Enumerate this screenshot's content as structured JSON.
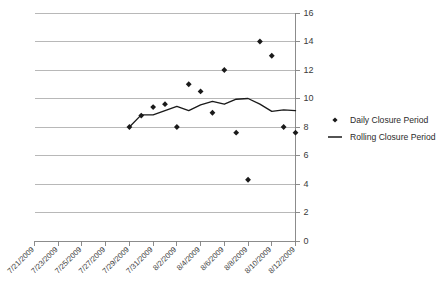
{
  "chart_data": {
    "type": "scatter",
    "title": "",
    "xlabel": "",
    "ylabel": "",
    "ylim": [
      0,
      16
    ],
    "ytick_step": 2,
    "yticks": [
      "0",
      "2",
      "4",
      "6",
      "8",
      "10",
      "12",
      "14",
      "16"
    ],
    "grid": true,
    "legend_position": "right",
    "xticks": [
      "7/21/2009",
      "7/23/2009",
      "7/25/2009",
      "7/27/2009",
      "7/29/2009",
      "7/31/2009",
      "8/2/2009",
      "8/4/2009",
      "8/6/2009",
      "8/8/2009",
      "8/10/2009",
      "8/12/2009"
    ],
    "x_dates": [
      "7/21/2009",
      "7/22/2009",
      "7/23/2009",
      "7/24/2009",
      "7/25/2009",
      "7/26/2009",
      "7/27/2009",
      "7/28/2009",
      "7/29/2009",
      "7/30/2009",
      "7/31/2009",
      "8/1/2009",
      "8/2/2009",
      "8/3/2009",
      "8/4/2009",
      "8/5/2009",
      "8/6/2009",
      "8/7/2009",
      "8/8/2009",
      "8/9/2009",
      "8/10/2009",
      "8/11/2009",
      "8/12/2009"
    ],
    "series": [
      {
        "name": "Daily Closure Period",
        "type": "scatter",
        "marker": "diamond",
        "color": "#1a1a1a",
        "points": [
          {
            "x": "7/29/2009",
            "y": 8.0
          },
          {
            "x": "7/30/2009",
            "y": 8.8
          },
          {
            "x": "7/31/2009",
            "y": 9.4
          },
          {
            "x": "8/1/2009",
            "y": 9.6
          },
          {
            "x": "8/2/2009",
            "y": 8.0
          },
          {
            "x": "8/3/2009",
            "y": 11.0
          },
          {
            "x": "8/4/2009",
            "y": 10.5
          },
          {
            "x": "8/5/2009",
            "y": 9.0
          },
          {
            "x": "8/6/2009",
            "y": 12.0
          },
          {
            "x": "8/7/2009",
            "y": 7.6
          },
          {
            "x": "8/8/2009",
            "y": 4.3
          },
          {
            "x": "8/9/2009",
            "y": 14.0
          },
          {
            "x": "8/10/2009",
            "y": 13.0
          },
          {
            "x": "8/11/2009",
            "y": 8.0
          },
          {
            "x": "8/12/2009",
            "y": 7.6
          }
        ]
      },
      {
        "name": "Rolling Closure Period",
        "type": "line",
        "color": "#1a1a1a",
        "points": [
          {
            "x": "7/29/2009",
            "y": 8.0
          },
          {
            "x": "7/30/2009",
            "y": 8.85
          },
          {
            "x": "7/31/2009",
            "y": 8.85
          },
          {
            "x": "8/1/2009",
            "y": 9.15
          },
          {
            "x": "8/2/2009",
            "y": 9.45
          },
          {
            "x": "8/3/2009",
            "y": 9.15
          },
          {
            "x": "8/4/2009",
            "y": 9.55
          },
          {
            "x": "8/5/2009",
            "y": 9.8
          },
          {
            "x": "8/6/2009",
            "y": 9.6
          },
          {
            "x": "8/7/2009",
            "y": 9.95
          },
          {
            "x": "8/8/2009",
            "y": 10.0
          },
          {
            "x": "8/9/2009",
            "y": 9.6
          },
          {
            "x": "8/10/2009",
            "y": 9.1
          },
          {
            "x": "8/11/2009",
            "y": 9.2
          },
          {
            "x": "8/12/2009",
            "y": 9.15
          }
        ]
      }
    ]
  },
  "legend": {
    "items": [
      {
        "label": "Daily Closure Period",
        "symbol": "diamond"
      },
      {
        "label": "Rolling Closure Period",
        "symbol": "line"
      }
    ]
  },
  "colors": {
    "gridline": "#a6a6a6",
    "axis": "#808080",
    "series": "#1a1a1a",
    "text": "#2b2b2b",
    "background": "#ffffff"
  }
}
